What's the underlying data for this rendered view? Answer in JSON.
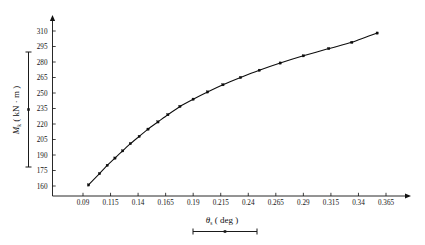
{
  "figure": {
    "background_color": "#ffffff",
    "ink_color": "#0d0d0d"
  },
  "axis_titles": {
    "y_symbol": "M",
    "y_subscript": "k",
    "y_units": "( kN · m )",
    "y_full": "Mₖ ( kN · m )",
    "x_symbol": "θ",
    "x_subscript": "s",
    "x_units": "( deg )",
    "x_full": "θₛ ( deg )"
  },
  "chart_data": {
    "type": "line",
    "title": "",
    "subtitle": "",
    "xlabel": "θₛ ( deg )",
    "ylabel": "Mₖ ( kN · m )",
    "xlim": [
      0.0715,
      0.3835
    ],
    "ylim": [
      152.5,
      317.5
    ],
    "grid": false,
    "legend": null,
    "marker": "square",
    "line_style": "solid",
    "xticks": [
      0.09,
      0.115,
      0.14,
      0.165,
      0.19,
      0.215,
      0.24,
      0.265,
      0.29,
      0.315,
      0.34,
      0.365
    ],
    "xtick_labels": [
      "0.09",
      "0.115",
      "0.14",
      "0.165",
      "0.19",
      "0.215",
      "0.24",
      "0.265",
      "0.29",
      "0.315",
      "0.34",
      "0.365"
    ],
    "yticks": [
      160,
      175,
      190,
      205,
      220,
      235,
      250,
      265,
      280,
      295,
      310
    ],
    "ytick_labels": [
      "160",
      "175",
      "190",
      "205",
      "220",
      "235",
      "250",
      "265",
      "280",
      "295",
      "310"
    ],
    "series": [
      {
        "name": "Mk vs theta_s",
        "x": [
          0.095,
          0.105,
          0.112,
          0.119,
          0.126,
          0.133,
          0.141,
          0.149,
          0.158,
          0.167,
          0.178,
          0.19,
          0.203,
          0.217,
          0.233,
          0.25,
          0.269,
          0.29,
          0.313,
          0.334,
          0.357
        ],
        "y": [
          161,
          172,
          180,
          187,
          194,
          201,
          208,
          215,
          222,
          229,
          237,
          244,
          251,
          258,
          265,
          272,
          279,
          286,
          293,
          299,
          308
        ]
      }
    ]
  },
  "annotations": {
    "y_label_rule": "vertical-bar-with-endcaps",
    "x_label_rule": "horizontal-bar-with-endcaps"
  }
}
